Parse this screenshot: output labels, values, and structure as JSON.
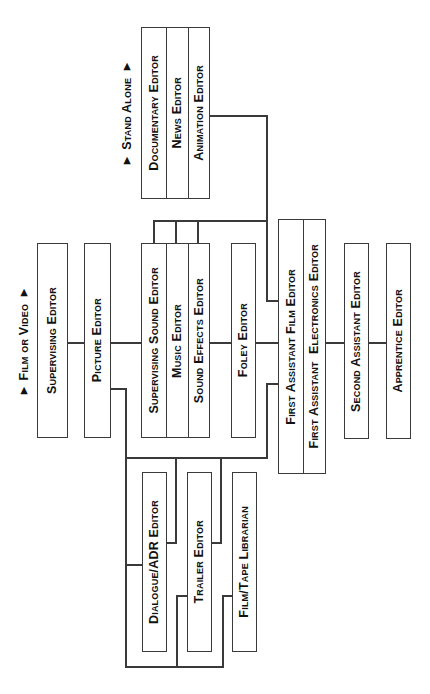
{
  "colors": {
    "line": "#3a3a3a",
    "text": "#111111",
    "background": "#ffffff"
  },
  "groups": {
    "film_or_video": {
      "label": "▼ Film or Video ▼"
    },
    "stand_alone": {
      "label": "▼ Stand Alone ▼"
    }
  },
  "nodes": {
    "documentary_editor": "Documentary Editor",
    "news_editor": "News Editor",
    "animation_editor": "Animation Editor",
    "supervising_editor": "Supervising Editor",
    "picture_editor": "Picture Editor",
    "supervising_sound_editor": "Supervising Sound Editor",
    "music_editor": "Music Editor",
    "sound_effects_editor": "Sound Effects Editor",
    "foley_editor": "Foley Editor",
    "first_assistant_film_editor": "First Assistant Film Editor",
    "first_assistant_electronics_editor": "First Assistant  Electronics Editor",
    "second_assistant_editor": "Second Assistant Editor",
    "apprentice_editor": "Apprentice Editor",
    "dialogue_adr_editor": "Dialogue/ADR Editor",
    "trailer_editor": "Trailer Editor",
    "film_tape_librarian": "Film/Tape Librarian"
  }
}
